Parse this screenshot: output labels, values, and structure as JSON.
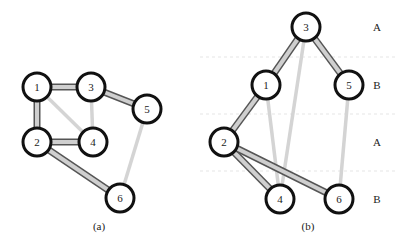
{
  "figures": [
    {
      "caption": "(a)",
      "nodes": [
        {
          "id": "1",
          "label": "1",
          "x": 37,
          "y": 87
        },
        {
          "id": "3",
          "label": "3",
          "x": 91,
          "y": 87
        },
        {
          "id": "5",
          "label": "5",
          "x": 147,
          "y": 109
        },
        {
          "id": "2",
          "label": "2",
          "x": 37,
          "y": 142
        },
        {
          "id": "4",
          "label": "4",
          "x": 93,
          "y": 142
        },
        {
          "id": "6",
          "label": "6",
          "x": 120,
          "y": 198
        }
      ],
      "edges": [
        {
          "from": "1",
          "to": "3",
          "style": "heavy"
        },
        {
          "from": "1",
          "to": "2",
          "style": "heavy"
        },
        {
          "from": "3",
          "to": "5",
          "style": "heavy"
        },
        {
          "from": "2",
          "to": "4",
          "style": "heavy"
        },
        {
          "from": "2",
          "to": "6",
          "style": "heavy"
        },
        {
          "from": "1",
          "to": "4",
          "style": "light"
        },
        {
          "from": "3",
          "to": "4",
          "style": "light"
        },
        {
          "from": "5",
          "to": "6",
          "style": "light"
        }
      ]
    },
    {
      "caption": "(b)",
      "nodes": [
        {
          "id": "3",
          "label": "3",
          "x": 306,
          "y": 27
        },
        {
          "id": "1",
          "label": "1",
          "x": 266,
          "y": 85
        },
        {
          "id": "5",
          "label": "5",
          "x": 349,
          "y": 85
        },
        {
          "id": "2",
          "label": "2",
          "x": 224,
          "y": 142
        },
        {
          "id": "4",
          "label": "4",
          "x": 280,
          "y": 199
        },
        {
          "id": "6",
          "label": "6",
          "x": 339,
          "y": 199
        }
      ],
      "edges": [
        {
          "from": "3",
          "to": "1",
          "style": "heavy"
        },
        {
          "from": "3",
          "to": "5",
          "style": "heavy"
        },
        {
          "from": "1",
          "to": "2",
          "style": "heavy"
        },
        {
          "from": "2",
          "to": "4",
          "style": "heavy"
        },
        {
          "from": "2",
          "to": "6",
          "style": "heavy"
        },
        {
          "from": "3",
          "to": "4",
          "style": "light"
        },
        {
          "from": "1",
          "to": "4",
          "style": "light"
        },
        {
          "from": "5",
          "to": "6",
          "style": "light"
        }
      ],
      "layers": [
        {
          "label": "A",
          "y": 27
        },
        {
          "label": "B",
          "y": 85
        },
        {
          "label": "A",
          "y": 142
        },
        {
          "label": "B",
          "y": 199
        }
      ],
      "layer_separators_y": [
        57,
        114,
        171
      ]
    }
  ],
  "colors": {
    "node_stroke": "#111111",
    "heavy_edge_outline": "#555555",
    "heavy_edge_fill": "#cfcfcf",
    "light_edge": "#d4d4d4",
    "separator": "#eeeeee"
  }
}
